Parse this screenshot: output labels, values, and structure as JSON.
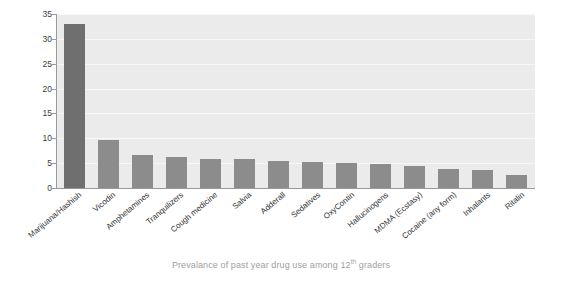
{
  "chart_data": {
    "type": "bar",
    "title": "",
    "caption": "Prevalance of past year drug use among 12",
    "caption_sup": "th",
    "caption_tail": " graders",
    "xlabel": "",
    "ylabel": "Percent",
    "ylim": [
      0,
      35
    ],
    "yticks": [
      "0",
      "5",
      "10",
      "15",
      "20",
      "25",
      "30",
      "35"
    ],
    "grid": true,
    "legend": "none",
    "bar_color": "#8c8c8c",
    "bar_color_highlight": "#6f6f6f",
    "plot_background": "#ebebeb",
    "categories": [
      "Marijuana/Hashish",
      "Vicodin",
      "Amphetamines",
      "Tranquilizers",
      "Cough medicine",
      "Salvia",
      "Adderall",
      "Sedatives",
      "OxyContin",
      "Hallucinogens",
      "MDMA (Ecstasy)",
      "Cocaine (any form)",
      "Inhalants",
      "Ritalin"
    ],
    "values": [
      33.0,
      9.7,
      6.6,
      6.2,
      5.9,
      5.8,
      5.4,
      5.2,
      5.1,
      4.8,
      4.5,
      3.8,
      3.6,
      2.6
    ]
  }
}
